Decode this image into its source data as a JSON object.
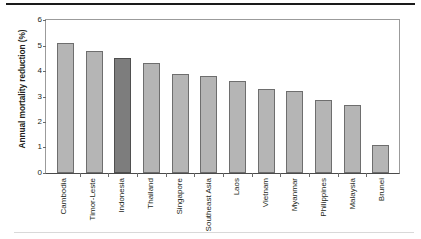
{
  "chart_data": {
    "type": "bar",
    "title": "",
    "xlabel": "",
    "ylabel": "Annual mortality reduction (%)",
    "ylim": [
      0,
      6
    ],
    "yticks": [
      0,
      1,
      2,
      3,
      4,
      5,
      6
    ],
    "ytick_labels": [
      "0",
      "1",
      "2",
      "3",
      "4",
      "5",
      "6"
    ],
    "grid": false,
    "legend": "none",
    "categories": [
      "Cambodia",
      "Timor-Leste",
      "Indonesia",
      "Thailand",
      "Singapore",
      "Southeast Asia",
      "Laos",
      "Vietnam",
      "Myanmar",
      "Philippines",
      "Malaysia",
      "Brunei"
    ],
    "values": [
      5.1,
      4.8,
      4.5,
      4.3,
      3.9,
      3.8,
      3.6,
      3.3,
      3.2,
      2.85,
      2.65,
      1.1
    ],
    "highlight_index": 2,
    "colors": {
      "bar": "#b5b5b5",
      "bar_border": "#6e6e6e",
      "bar_highlight": "#7d7d7d",
      "bar_highlight_border": "#4f4f4f",
      "axis": "#4a4a4a",
      "frame": "#9b9b9b",
      "text": "#231f20",
      "top_rule": "#1a1a1a",
      "bottom_rule": "#d9d9d9"
    }
  }
}
